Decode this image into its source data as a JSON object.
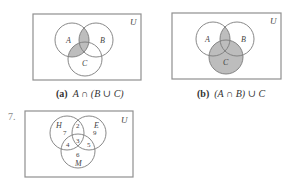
{
  "colors": {
    "box_stroke": "#8f8f8f",
    "circle_stroke": "#7a7a7a",
    "shade": "#bdbdbd",
    "text": "#444444"
  },
  "diagram_a": {
    "universe_label": "U",
    "set_labels": [
      "A",
      "B",
      "C"
    ],
    "caption_tag": "(a)",
    "caption_expr": "A ∩ (B ∪ C)",
    "shaded_region": "A ∩ (B ∪ C)"
  },
  "diagram_b": {
    "universe_label": "U",
    "set_labels": [
      "A",
      "B",
      "C"
    ],
    "caption_tag": "(b)",
    "caption_expr": "(A ∩ B) ∪ C",
    "shaded_region": "(A ∩ B) ∪ C"
  },
  "exercise_7": {
    "number": "7.",
    "universe_label": "U",
    "set_labels": [
      "H",
      "E",
      "M"
    ],
    "region_counts": {
      "H_only": "7",
      "H_and_E_only": "2",
      "E_only": "9",
      "H_and_M_only": "4",
      "all_three": "3",
      "E_and_M_only": "5",
      "M_only": "6"
    }
  }
}
